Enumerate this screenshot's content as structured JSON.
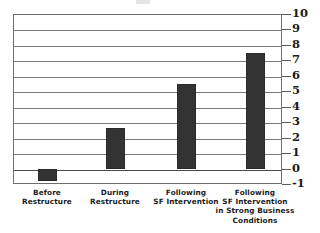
{
  "chart_data": {
    "type": "bar",
    "title": "",
    "subtitle": "",
    "xlabel": "",
    "ylabel": "",
    "categories": [
      "Before Restructure",
      "During Restructure",
      "Following SF Intervention",
      "Following SF Intervention in Strong Business Conditions"
    ],
    "category_lines": [
      [
        "Before",
        "Restructure"
      ],
      [
        "During",
        "Restructure"
      ],
      [
        "Following",
        "SF Intervention"
      ],
      [
        "Following",
        "SF Intervention",
        "in Strong Business",
        "Conditions"
      ]
    ],
    "values": [
      -0.8,
      2.6,
      5.5,
      7.5
    ],
    "ylim": [
      -1,
      10
    ],
    "yticks": [
      10,
      9,
      8,
      7,
      6,
      5,
      4,
      3,
      2,
      1,
      0,
      -1
    ],
    "ytick_labels": [
      "10",
      "9",
      "8",
      "7",
      "6",
      "5",
      "4",
      "3",
      "2",
      "1",
      "0",
      "-1"
    ],
    "grid": true,
    "grid_axis": "y",
    "legend": false,
    "legend_position": "none",
    "y_axis_side": "right",
    "bar_color": "#333333",
    "gridline_color": "#7a7a7a",
    "frame_color": "#6e6e6e",
    "background_color": "#ffffff"
  }
}
